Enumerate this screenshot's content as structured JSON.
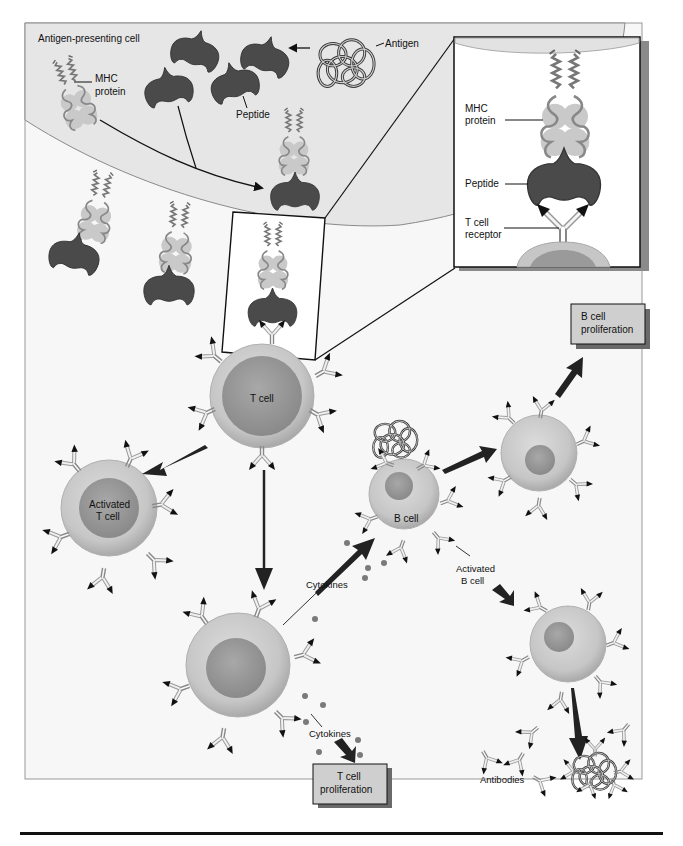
{
  "diagram": {
    "colors": {
      "frame_bg": "#f7f7f7",
      "apc_membrane": "#e6e6e6",
      "peptide": "#4a4a4a",
      "mhc": "#bdbdbd",
      "cell_outer": "#c9c9c9",
      "cell_nucleus": "#9a9a9a",
      "box_fill": "#cfcfcf",
      "rule": "#111111"
    },
    "labels": {
      "apc": "Antigen-presenting cell",
      "mhc_line1": "MHC",
      "mhc_line2": "protein",
      "antigen": "Antigen",
      "peptide": "Peptide",
      "t_cell": "T cell",
      "activated_t_line1": "Activated",
      "activated_t_line2": "T cell",
      "b_cell": "B cell",
      "activated_b_line1": "Activated",
      "activated_b_line2": "B cell",
      "cytokines_upper": "Cytokines",
      "cytokines_lower": "Cytokines",
      "antibodies": "Antibodies"
    },
    "inset": {
      "mhc_line1": "MHC",
      "mhc_line2": "protein",
      "peptide": "Peptide",
      "tcr_line1": "T cell",
      "tcr_line2": "receptor"
    },
    "boxes": {
      "b_prolif_line1": "B cell",
      "b_prolif_line2": "proliferation",
      "t_prolif_line1": "T cell",
      "t_prolif_line2": "proliferation"
    }
  }
}
